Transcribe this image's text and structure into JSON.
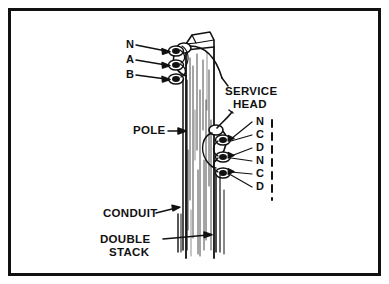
{
  "figure": {
    "frame": {
      "border_color": "#111111",
      "background": "#ffffff"
    },
    "line_color": "#111111"
  },
  "labels": {
    "upper_conductors": [
      {
        "id": "upper-n",
        "text": "N",
        "x": 126,
        "y": 45
      },
      {
        "id": "upper-a",
        "text": "A",
        "x": 126,
        "y": 60
      },
      {
        "id": "upper-b",
        "text": "B",
        "x": 126,
        "y": 75
      }
    ],
    "lower_conductors": [
      {
        "id": "lower-n1",
        "text": "N",
        "x": 256,
        "y": 122
      },
      {
        "id": "lower-c1",
        "text": "C",
        "x": 256,
        "y": 135
      },
      {
        "id": "lower-d1",
        "text": "D",
        "x": 256,
        "y": 148
      },
      {
        "id": "lower-n2",
        "text": "N",
        "x": 256,
        "y": 161
      },
      {
        "id": "lower-c2",
        "text": "C",
        "x": 256,
        "y": 174
      },
      {
        "id": "lower-d2",
        "text": "D",
        "x": 256,
        "y": 187
      }
    ],
    "service_head_line1": "SERVICE",
    "service_head_line2": "HEAD",
    "pole": "POLE",
    "conduit": "CONDUIT",
    "double_stack_line1": "DOUBLE",
    "double_stack_line2": "STACK"
  }
}
